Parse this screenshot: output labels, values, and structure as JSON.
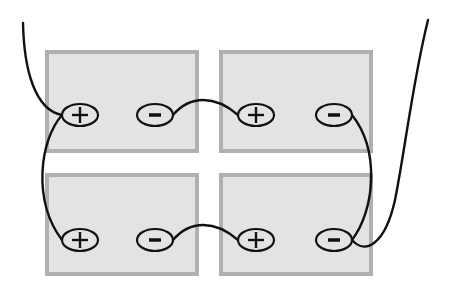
{
  "diagram": {
    "type": "battery-wiring",
    "colors": {
      "background": "#ffffff",
      "battery_fill": "#e3e3e3",
      "battery_border": "#b0b0b0",
      "wire": "#111111"
    },
    "batteries": [
      {
        "id": "battery-top-left",
        "terminals": [
          {
            "polarity": "+",
            "label": "+"
          },
          {
            "polarity": "-",
            "label": "−"
          }
        ]
      },
      {
        "id": "battery-top-right",
        "terminals": [
          {
            "polarity": "+",
            "label": "+"
          },
          {
            "polarity": "-",
            "label": "−"
          }
        ]
      },
      {
        "id": "battery-bottom-left",
        "terminals": [
          {
            "polarity": "+",
            "label": "+"
          },
          {
            "polarity": "-",
            "label": "−"
          }
        ]
      },
      {
        "id": "battery-bottom-right",
        "terminals": [
          {
            "polarity": "+",
            "label": "+"
          },
          {
            "polarity": "-",
            "label": "−"
          }
        ]
      }
    ],
    "connections": [
      {
        "from": "top-left -",
        "to": "top-right +"
      },
      {
        "from": "bottom-left -",
        "to": "bottom-right +"
      },
      {
        "from": "top-left +",
        "to": "bottom-left +"
      },
      {
        "from": "top-right -",
        "to": "bottom-right -"
      },
      {
        "from": "top-left +",
        "to": "output lead (left)"
      },
      {
        "from": "bottom-right -",
        "to": "output lead (right)"
      }
    ]
  }
}
